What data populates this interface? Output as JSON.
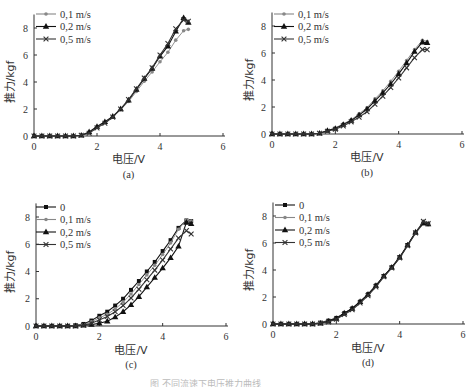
{
  "figure": {
    "bottom_caption": "图 不同流速下电压推力曲线"
  },
  "chart_data": [
    {
      "id": "a",
      "type": "line",
      "subtitle": "(a)",
      "xlabel": "电压/V",
      "ylabel": "推力/kgf",
      "xlim": [
        0,
        6
      ],
      "ylim": [
        0,
        9
      ],
      "xticks": [
        0,
        2,
        4,
        6
      ],
      "yticks": [
        0,
        2,
        4,
        6,
        8
      ],
      "grid": false,
      "legend_position": "upper-left",
      "x": [
        0,
        0.25,
        0.5,
        0.75,
        1.0,
        1.25,
        1.5,
        1.75,
        2.0,
        2.25,
        2.5,
        2.75,
        3.0,
        3.25,
        3.5,
        3.75,
        4.0,
        4.25,
        4.5,
        4.75,
        4.9
      ],
      "series": [
        {
          "name": "0.1 m/s",
          "marker": "dot",
          "color": "#888888",
          "values": [
            0,
            0,
            0,
            0,
            0,
            0,
            0.05,
            0.25,
            0.65,
            1.0,
            1.4,
            1.95,
            2.55,
            3.3,
            4.05,
            4.75,
            5.5,
            6.2,
            7.1,
            7.8,
            7.9
          ]
        },
        {
          "name": "0.2 m/s",
          "marker": "triangle",
          "color": "#111111",
          "values": [
            0,
            0,
            0,
            0,
            0,
            0,
            0.05,
            0.3,
            0.7,
            1.05,
            1.45,
            2.0,
            2.65,
            3.45,
            4.25,
            5.0,
            5.9,
            6.65,
            7.75,
            8.75,
            8.4
          ]
        },
        {
          "name": "0.5 m/s",
          "marker": "x",
          "color": "#333333",
          "values": [
            0,
            0,
            0,
            0,
            0,
            0,
            0.05,
            0.2,
            0.6,
            0.95,
            1.4,
            2.0,
            2.7,
            3.5,
            4.3,
            5.05,
            6.0,
            6.85,
            7.95,
            8.6,
            8.5
          ]
        }
      ]
    },
    {
      "id": "b",
      "type": "line",
      "subtitle": "(b)",
      "xlabel": "电压/V",
      "ylabel": "推力/kgf",
      "xlim": [
        0,
        6
      ],
      "ylim": [
        0,
        9
      ],
      "xticks": [
        0,
        2,
        4,
        6
      ],
      "yticks": [
        0,
        2,
        4,
        6,
        8
      ],
      "grid": false,
      "legend_position": "upper-left",
      "x": [
        0,
        0.25,
        0.5,
        0.75,
        1.0,
        1.25,
        1.5,
        1.75,
        2.0,
        2.25,
        2.5,
        2.75,
        3.0,
        3.25,
        3.5,
        3.75,
        4.0,
        4.25,
        4.5,
        4.75,
        4.9
      ],
      "series": [
        {
          "name": "0.1 m/s",
          "marker": "dot",
          "color": "#888888",
          "values": [
            0,
            0,
            0,
            0,
            0,
            0,
            0.05,
            0.25,
            0.45,
            0.75,
            1.05,
            1.5,
            1.95,
            2.6,
            3.2,
            3.9,
            4.65,
            5.45,
            6.25,
            6.95,
            6.85
          ]
        },
        {
          "name": "0.2 m/s",
          "marker": "triangle",
          "color": "#111111",
          "values": [
            0,
            0,
            0,
            0,
            0,
            0,
            0.05,
            0.25,
            0.4,
            0.7,
            1.0,
            1.4,
            1.85,
            2.45,
            3.05,
            3.7,
            4.45,
            5.25,
            6.1,
            6.8,
            6.75
          ]
        },
        {
          "name": "0.5 m/s",
          "marker": "x",
          "color": "#333333",
          "values": [
            0,
            0,
            0,
            0,
            0,
            0,
            0.05,
            0.2,
            0.35,
            0.6,
            0.9,
            1.25,
            1.65,
            2.2,
            2.8,
            3.45,
            4.15,
            4.9,
            5.65,
            6.25,
            6.25
          ]
        }
      ]
    },
    {
      "id": "c",
      "type": "line",
      "subtitle": "(c)",
      "xlabel": "电压/V",
      "ylabel": "推力/kgf",
      "xlim": [
        0,
        6
      ],
      "ylim": [
        0,
        9
      ],
      "xticks": [
        0,
        2,
        4,
        6
      ],
      "yticks": [
        0,
        2,
        4,
        6,
        8
      ],
      "grid": false,
      "legend_position": "upper-left",
      "x": [
        0,
        0.25,
        0.5,
        0.75,
        1.0,
        1.25,
        1.5,
        1.75,
        2.0,
        2.25,
        2.5,
        2.75,
        3.0,
        3.25,
        3.5,
        3.75,
        4.0,
        4.25,
        4.5,
        4.75,
        4.9
      ],
      "series": [
        {
          "name": "0",
          "marker": "square",
          "color": "#111111",
          "values": [
            0,
            0,
            0,
            0,
            0,
            0.05,
            0.15,
            0.4,
            0.75,
            1.05,
            1.5,
            2.0,
            2.65,
            3.3,
            4.0,
            4.7,
            5.5,
            6.3,
            7.2,
            7.75,
            7.7
          ]
        },
        {
          "name": "0.1 m/s",
          "marker": "dot",
          "color": "#888888",
          "values": [
            0,
            0,
            0,
            0,
            0,
            0.05,
            0.1,
            0.3,
            0.6,
            0.85,
            1.25,
            1.75,
            2.35,
            3.05,
            3.75,
            4.45,
            5.25,
            6.1,
            7.1,
            7.8,
            7.7
          ]
        },
        {
          "name": "0.2 m/s",
          "marker": "triangle",
          "color": "#111111",
          "values": [
            0,
            0,
            0,
            0,
            0,
            0,
            0.05,
            0.1,
            0.2,
            0.35,
            0.65,
            1.05,
            1.55,
            2.15,
            2.85,
            3.55,
            4.25,
            5.0,
            5.85,
            7.6,
            7.5
          ]
        },
        {
          "name": "0.5 m/s",
          "marker": "x",
          "color": "#333333",
          "values": [
            0,
            0,
            0,
            0,
            0,
            0,
            0.05,
            0.2,
            0.45,
            0.7,
            1.05,
            1.5,
            2.05,
            2.7,
            3.4,
            4.1,
            4.85,
            5.65,
            6.45,
            7.0,
            6.75
          ]
        }
      ]
    },
    {
      "id": "d",
      "type": "line",
      "subtitle": "(d)",
      "xlabel": "电压/V",
      "ylabel": "推力/kgf",
      "xlim": [
        0,
        6
      ],
      "ylim": [
        0,
        9
      ],
      "xticks": [
        0,
        2,
        4,
        6
      ],
      "yticks": [
        0,
        2,
        4,
        6,
        8
      ],
      "grid": false,
      "legend_position": "upper-left",
      "x": [
        0,
        0.25,
        0.5,
        0.75,
        1.0,
        1.25,
        1.5,
        1.75,
        2.0,
        2.25,
        2.5,
        2.75,
        3.0,
        3.25,
        3.5,
        3.75,
        4.0,
        4.25,
        4.5,
        4.75,
        4.9
      ],
      "series": [
        {
          "name": "0",
          "marker": "square",
          "color": "#111111",
          "values": [
            0,
            0,
            0,
            0,
            0,
            0,
            0.1,
            0.25,
            0.45,
            0.8,
            1.15,
            1.65,
            2.2,
            2.85,
            3.55,
            4.2,
            4.95,
            5.85,
            6.75,
            7.45,
            7.4
          ]
        },
        {
          "name": "0.1 m/s",
          "marker": "dot",
          "color": "#888888",
          "values": [
            0,
            0,
            0,
            0,
            0,
            0,
            0.1,
            0.2,
            0.4,
            0.75,
            1.1,
            1.6,
            2.15,
            2.8,
            3.5,
            4.15,
            4.9,
            5.8,
            6.7,
            7.45,
            7.35
          ]
        },
        {
          "name": "0.2 m/s",
          "marker": "triangle",
          "color": "#111111",
          "values": [
            0,
            0,
            0,
            0,
            0,
            0,
            0.05,
            0.2,
            0.4,
            0.8,
            1.15,
            1.65,
            2.2,
            2.85,
            3.55,
            4.2,
            4.95,
            5.85,
            6.8,
            7.5,
            7.4
          ]
        },
        {
          "name": "0.5 m/s",
          "marker": "x",
          "color": "#333333",
          "values": [
            0,
            0,
            0,
            0,
            0,
            0,
            0.05,
            0.15,
            0.35,
            0.7,
            1.05,
            1.55,
            2.1,
            2.75,
            3.5,
            4.15,
            4.9,
            5.8,
            6.75,
            7.6,
            7.45
          ]
        }
      ]
    }
  ],
  "layout": {
    "panels": [
      {
        "id": "a",
        "x0": 34,
        "x6": 223,
        "y0": 136,
        "y8": 28,
        "legend_x": 44,
        "legend_y": 14,
        "ylabel_x": 14,
        "ylabel_y": 82,
        "xlabel_y": 163,
        "sub_y": 178
      },
      {
        "id": "b",
        "x0": 272,
        "x6": 462,
        "y0": 134,
        "y8": 26,
        "legend_x": 282,
        "legend_y": 14,
        "ylabel_x": 253,
        "ylabel_y": 80,
        "xlabel_y": 161,
        "sub_y": 176
      },
      {
        "id": "c",
        "x0": 36,
        "x6": 226,
        "y0": 326,
        "y8": 217,
        "legend_x": 44,
        "legend_y": 207,
        "ylabel_x": 14,
        "ylabel_y": 272,
        "xlabel_y": 354,
        "sub_y": 368
      },
      {
        "id": "d",
        "x0": 273,
        "x6": 463,
        "y0": 324,
        "y8": 216,
        "legend_x": 283,
        "legend_y": 205,
        "ylabel_x": 253,
        "ylabel_y": 270,
        "xlabel_y": 352,
        "sub_y": 366
      }
    ]
  }
}
